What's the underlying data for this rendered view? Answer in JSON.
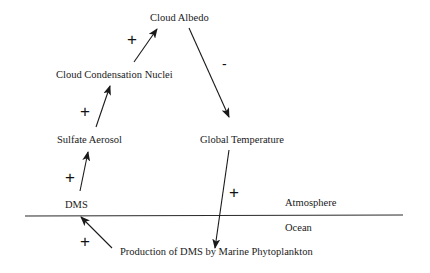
{
  "diagram": {
    "nodes": {
      "cloud_albedo": "Cloud Albedo",
      "ccn": "Cloud Condensation Nuclei",
      "sulfate_aerosol": "Sulfate Aerosol",
      "dms": "DMS",
      "global_temperature": "Global Temperature",
      "production": "Production of DMS by Marine Phytoplankton"
    },
    "regions": {
      "atmosphere": "Atmosphere",
      "ocean": "Ocean"
    },
    "edges": [
      {
        "from": "Production of DMS by Marine Phytoplankton",
        "to": "DMS",
        "sign": "+"
      },
      {
        "from": "DMS",
        "to": "Sulfate Aerosol",
        "sign": "+"
      },
      {
        "from": "Sulfate Aerosol",
        "to": "Cloud Condensation Nuclei",
        "sign": "+"
      },
      {
        "from": "Cloud Condensation Nuclei",
        "to": "Cloud Albedo",
        "sign": "+"
      },
      {
        "from": "Cloud Albedo",
        "to": "Global Temperature",
        "sign": "-"
      },
      {
        "from": "Global Temperature",
        "to": "Production of DMS by Marine Phytoplankton",
        "sign": "+"
      }
    ],
    "signs": {
      "prod_to_dms": "+",
      "dms_to_sa": "+",
      "sa_to_ccn": "+",
      "ccn_to_albedo": "+",
      "albedo_to_temp": "-",
      "temp_to_prod": "+"
    },
    "colors": {
      "ink": "#1a1a1a",
      "background": "#ffffff"
    }
  }
}
